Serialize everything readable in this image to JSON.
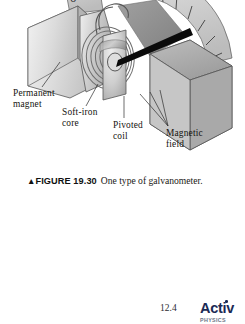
{
  "page": {
    "background_color": "#ffffff",
    "width": 245,
    "height": 324
  },
  "figure": {
    "illustration_name": "galvanometer-cutaway-illustration",
    "scale": {
      "tick_label": "10",
      "tick_count": 7
    },
    "colors": {
      "magnet_light": "#d8d8d8",
      "magnet_mid": "#bcbcbc",
      "magnet_dark": "#9a9a9a",
      "core_gray": "#c9c9c9",
      "needle_black": "#0b0b0b",
      "outline": "#3b3b3b"
    },
    "callouts": [
      {
        "name": "permanent-magnet",
        "text": "Permanent\nmagnet"
      },
      {
        "name": "soft-iron-core",
        "text": "Soft-iron\ncore"
      },
      {
        "name": "pivoted-coil",
        "text": "Pivoted\ncoil"
      },
      {
        "name": "magnetic-field",
        "text": "Magnetic\nfield"
      }
    ],
    "caption": {
      "marker": "▲",
      "number": "FIGURE 19.30",
      "text": "One type of galvanometer."
    }
  },
  "footer": {
    "section_number": "12.4",
    "logo": {
      "wordmark": "Activ",
      "subword": "PHYSICS"
    }
  }
}
